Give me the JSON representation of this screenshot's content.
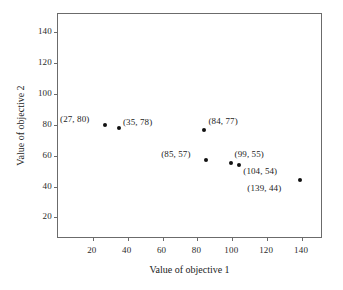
{
  "chart_data": {
    "type": "scatter",
    "title": "",
    "xlabel": "Value of objective 1",
    "ylabel": "Value of objective 2",
    "xlim": [
      0,
      152
    ],
    "ylim": [
      6,
      152
    ],
    "xticks": [
      20,
      40,
      60,
      80,
      100,
      120,
      140
    ],
    "yticks": [
      20,
      40,
      60,
      80,
      100,
      120,
      140
    ],
    "grid": false,
    "legend": null,
    "points": [
      {
        "x": 27,
        "y": 80,
        "label": "(27, 80)",
        "label_pos": "left"
      },
      {
        "x": 35,
        "y": 78,
        "label": "(35, 78)",
        "label_pos": "right"
      },
      {
        "x": 84,
        "y": 77,
        "label": "(84, 77)",
        "label_pos": "upper-right"
      },
      {
        "x": 85,
        "y": 57,
        "label": "(85, 57)",
        "label_pos": "left"
      },
      {
        "x": 99,
        "y": 55,
        "label": "(99, 55)",
        "label_pos": "upper-right"
      },
      {
        "x": 104,
        "y": 54,
        "label": "(104, 54)",
        "label_pos": "lower-right"
      },
      {
        "x": 139,
        "y": 44,
        "label": "(139, 44)",
        "label_pos": "lower-left"
      }
    ]
  }
}
